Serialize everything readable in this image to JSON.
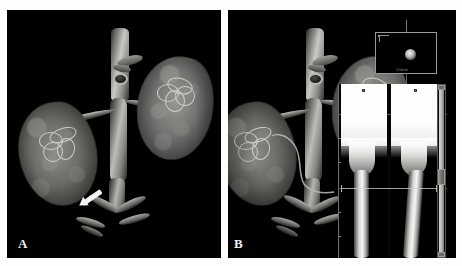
{
  "figure": {
    "panels": [
      {
        "id": "A",
        "label": "A",
        "modality": "3D volume-rendered CT angiography",
        "description": "Volume-rendered CT angiogram of the abdominal aorta and both kidneys with bilateral renal arteries",
        "annotation": {
          "type": "arrow",
          "name": "white-arrow-marker",
          "points_to": "infrarenal abdominal aorta"
        }
      },
      {
        "id": "B",
        "label": "B",
        "modality": "3D volume-rendered CT angiography with vessel analysis overlay",
        "description": "Same volume-rendered CT angiogram with automated vessel-analysis software overlay and centerline tracking",
        "annotation": {
          "type": "centerline",
          "name": "vessel-centerline-path",
          "points_to": "right renal artery"
        }
      }
    ]
  },
  "overlay": {
    "axial_inset": {
      "name": "axial-cross-section",
      "scale_label": "10mm",
      "vessel_label": ""
    },
    "cpr_views": [
      {
        "name": "cpr-view-1",
        "marker": ""
      },
      {
        "name": "cpr-view-2",
        "marker": ""
      }
    ],
    "scrollbar": {
      "name": "slice-scrollbar"
    }
  },
  "watermarks": {
    "top_left": "",
    "top_center": ""
  },
  "colors": {
    "background": "#ffffff",
    "panel": "#000000",
    "annotation": "#f4f4f2",
    "overlay_line": "#9a9a97"
  }
}
